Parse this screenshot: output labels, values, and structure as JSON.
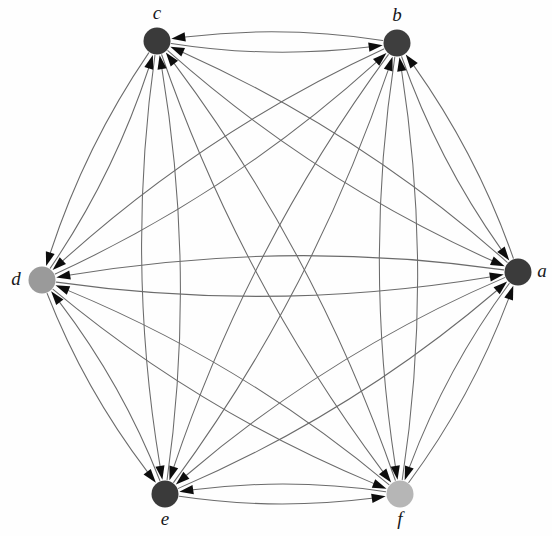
{
  "figure": {
    "name": "complete-directed-graph",
    "width": 552,
    "height": 536,
    "background_color": "#fefefe"
  },
  "style": {
    "edge_color": "#6b6b6b",
    "edge_width": 1.05,
    "arrow_color": "#0d0d0d",
    "arrow_length": 14,
    "arrow_half_width": 4.6,
    "label_color": "#17181a",
    "label_font_size": 19,
    "curvature": 0.085
  },
  "graph_data": {
    "type": "directed-graph",
    "layout": "circular",
    "node_count": 6,
    "edge_count": 30,
    "directed": true,
    "complete": true,
    "nodes": [
      {
        "id": "a",
        "label": "a",
        "x": 518,
        "y": 272,
        "r": 13.5,
        "color": "#3b3b3b",
        "label_dx": 24,
        "label_dy": 1,
        "in_degree": 5,
        "out_degree": 5
      },
      {
        "id": "b",
        "label": "b",
        "x": 397,
        "y": 43,
        "r": 13.5,
        "color": "#3e3e3e",
        "label_dx": 0,
        "label_dy": -26,
        "in_degree": 5,
        "out_degree": 5
      },
      {
        "id": "c",
        "label": "c",
        "x": 157,
        "y": 41,
        "r": 13.5,
        "color": "#3a3a3a",
        "label_dx": 0,
        "label_dy": -26,
        "in_degree": 5,
        "out_degree": 5
      },
      {
        "id": "d",
        "label": "d",
        "x": 42,
        "y": 280,
        "r": 13.5,
        "color": "#9a9a9a",
        "label_dx": -26,
        "label_dy": 1,
        "in_degree": 5,
        "out_degree": 5
      },
      {
        "id": "e",
        "label": "e",
        "x": 165,
        "y": 494,
        "r": 13.5,
        "color": "#3a3a3a",
        "label_dx": 0,
        "label_dy": 27,
        "in_degree": 5,
        "out_degree": 5
      },
      {
        "id": "f",
        "label": "f",
        "x": 400,
        "y": 494,
        "r": 13.5,
        "color": "#b6b6b6",
        "label_dx": 0,
        "label_dy": 27,
        "in_degree": 5,
        "out_degree": 5
      }
    ],
    "edges": [
      {
        "from": "a",
        "to": "b"
      },
      {
        "from": "b",
        "to": "a"
      },
      {
        "from": "a",
        "to": "c"
      },
      {
        "from": "c",
        "to": "a"
      },
      {
        "from": "a",
        "to": "d"
      },
      {
        "from": "d",
        "to": "a"
      },
      {
        "from": "a",
        "to": "e"
      },
      {
        "from": "e",
        "to": "a"
      },
      {
        "from": "a",
        "to": "f"
      },
      {
        "from": "f",
        "to": "a"
      },
      {
        "from": "b",
        "to": "c"
      },
      {
        "from": "c",
        "to": "b"
      },
      {
        "from": "b",
        "to": "d"
      },
      {
        "from": "d",
        "to": "b"
      },
      {
        "from": "b",
        "to": "e"
      },
      {
        "from": "e",
        "to": "b"
      },
      {
        "from": "b",
        "to": "f"
      },
      {
        "from": "f",
        "to": "b"
      },
      {
        "from": "c",
        "to": "d"
      },
      {
        "from": "d",
        "to": "c"
      },
      {
        "from": "c",
        "to": "e"
      },
      {
        "from": "e",
        "to": "c"
      },
      {
        "from": "c",
        "to": "f"
      },
      {
        "from": "f",
        "to": "c"
      },
      {
        "from": "d",
        "to": "e"
      },
      {
        "from": "e",
        "to": "d"
      },
      {
        "from": "d",
        "to": "f"
      },
      {
        "from": "f",
        "to": "d"
      },
      {
        "from": "e",
        "to": "f"
      },
      {
        "from": "f",
        "to": "e"
      }
    ]
  }
}
